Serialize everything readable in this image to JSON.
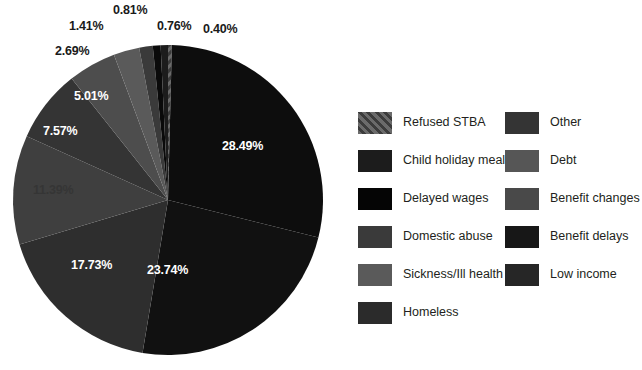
{
  "chart_data": {
    "type": "pie",
    "title": "",
    "xlabel": "",
    "ylabel": "",
    "legend_position": "right",
    "grid": false,
    "units": "percent",
    "start_angle_deg": 0,
    "direction": "clockwise",
    "categories": [
      "Refused STBA",
      "Low income",
      "Benefit delays",
      "Benefit changes",
      "Debt",
      "Other",
      "Homeless",
      "Sickness/Ill health",
      "Domestic abuse",
      "Delayed wages",
      "Child holiday meals"
    ],
    "values": [
      0.4,
      28.49,
      23.74,
      17.73,
      11.39,
      7.57,
      5.01,
      2.69,
      1.41,
      0.81,
      0.76
    ],
    "labels": [
      "0.40%",
      "28.49%",
      "23.74%",
      "17.73%",
      "11.39%",
      "7.57%",
      "5.01%",
      "2.69%",
      "1.41%",
      "0.81%",
      "0.76%"
    ],
    "colors": [
      "#4a4a4a",
      "#0d0d0d",
      "#111111",
      "#2e2e2e",
      "#3f3f3f",
      "#343434",
      "#4d4d4d",
      "#5a5a5a",
      "#3a3a3a",
      "#0a0a0a",
      "#1c1c1c"
    ]
  },
  "slice_labels": {
    "refused_stba": "0.40%",
    "low_income": "28.49%",
    "benefit_delays": "23.74%",
    "benefit_changes": "17.73%",
    "debt": "11.39%",
    "other": "7.57%",
    "homeless": "5.01%",
    "sickness": "2.69%",
    "domestic_abuse": "1.41%",
    "delayed_wages": "0.81%",
    "child_holiday_meals": "0.76%"
  },
  "legend": {
    "left_column": [
      {
        "label": "Refused STBA",
        "color": "#4a4a4a",
        "pattern": "diagonal-hatch"
      },
      {
        "label": "Child holiday meals",
        "color": "#1c1c1c",
        "pattern": "solid"
      },
      {
        "label": "Delayed wages",
        "color": "#050505",
        "pattern": "solid"
      },
      {
        "label": "Domestic abuse",
        "color": "#3a3a3a",
        "pattern": "solid"
      },
      {
        "label": "Sickness/Ill health",
        "color": "#5a5a5a",
        "pattern": "solid"
      },
      {
        "label": "Homeless",
        "color": "#2b2b2b",
        "pattern": "solid"
      }
    ],
    "right_column": [
      {
        "label": "Other",
        "color": "#343434",
        "pattern": "solid"
      },
      {
        "label": "Debt",
        "color": "#565656",
        "pattern": "solid"
      },
      {
        "label": "Benefit changes",
        "color": "#494949",
        "pattern": "solid"
      },
      {
        "label": "Benefit delays",
        "color": "#171717",
        "pattern": "solid"
      },
      {
        "label": "Low income",
        "color": "#262626",
        "pattern": "solid"
      }
    ]
  }
}
